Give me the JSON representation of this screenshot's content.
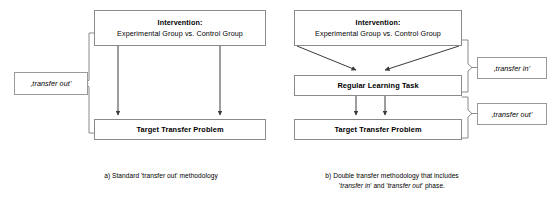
{
  "figure": {
    "panels": [
      {
        "id": "a",
        "caption_lines": [
          "a) Standard 'transfer out' methodology"
        ],
        "nodes": {
          "intervention": {
            "title": "Intervention:",
            "subtitle": "Experimental Group vs. Control Group"
          },
          "target": {
            "title": "Target Transfer Problem"
          }
        },
        "tags": {
          "transfer_out": "‚transfer out'"
        }
      },
      {
        "id": "b",
        "caption_lines": [
          "b) Double transfer methodology that includes",
          "'transfer in' and 'transfer out' phase."
        ],
        "caption_italic_terms": [
          "transfer in",
          "transfer out"
        ],
        "nodes": {
          "intervention": {
            "title": "Intervention:",
            "subtitle": "Experimental Group vs. Control Group"
          },
          "regular": {
            "title": "Regular Learning Task"
          },
          "target": {
            "title": "Target Transfer Problem"
          }
        },
        "tags": {
          "transfer_in": "‚transfer in'",
          "transfer_out": "‚transfer out'"
        }
      }
    ],
    "colors": {
      "box_border": "#8a8a8a",
      "line": "#3a3a3a",
      "bracket": "#8a8a8a",
      "text": "#000000",
      "background": "#ffffff"
    }
  }
}
